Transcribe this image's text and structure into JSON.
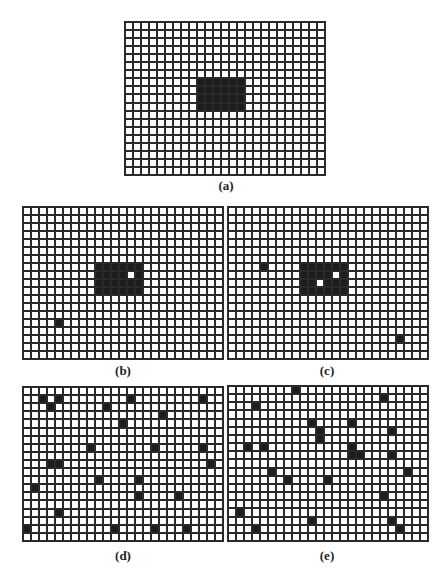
{
  "figure": {
    "grid_cols": 25,
    "grid_rows": 19,
    "colors": {
      "line": "#2a2a2a",
      "dark": "#1c1c1c",
      "light": "#ffffff"
    },
    "panels": [
      {
        "id": "a",
        "label": "(a)",
        "box": {
          "left": 124,
          "top": 21,
          "width": 202,
          "height": 155
        },
        "label_pos": {
          "left": 196,
          "top": 178
        },
        "rects": [
          {
            "col": 9,
            "row": 7,
            "cols": 6,
            "rows": 4
          }
        ],
        "dark_cells": [],
        "light_holes": []
      },
      {
        "id": "b",
        "label": "(b)",
        "box": {
          "left": 22,
          "top": 206,
          "width": 202,
          "height": 154
        },
        "label_pos": {
          "left": 93,
          "top": 363
        },
        "rects": [
          {
            "col": 9,
            "row": 7,
            "cols": 6,
            "rows": 4
          }
        ],
        "dark_cells": [
          [
            4,
            14
          ]
        ],
        "light_holes": [
          [
            13,
            8
          ]
        ]
      },
      {
        "id": "c",
        "label": "(c)",
        "box": {
          "left": 227,
          "top": 206,
          "width": 202,
          "height": 154
        },
        "label_pos": {
          "left": 297,
          "top": 363
        },
        "rects": [
          {
            "col": 9,
            "row": 7,
            "cols": 6,
            "rows": 4
          }
        ],
        "dark_cells": [
          [
            4,
            7
          ],
          [
            21,
            16
          ]
        ],
        "light_holes": [
          [
            13,
            8
          ],
          [
            11,
            9
          ]
        ]
      },
      {
        "id": "d",
        "label": "(d)",
        "box": {
          "left": 22,
          "top": 386,
          "width": 202,
          "height": 156
        },
        "label_pos": {
          "left": 93,
          "top": 548
        },
        "rects": [],
        "dark_cells": [
          [
            2,
            1
          ],
          [
            4,
            1
          ],
          [
            3,
            2
          ],
          [
            13,
            1
          ],
          [
            10,
            2
          ],
          [
            22,
            1
          ],
          [
            17,
            3
          ],
          [
            12,
            4
          ],
          [
            8,
            7
          ],
          [
            16,
            7
          ],
          [
            22,
            7
          ],
          [
            3,
            9
          ],
          [
            4,
            9
          ],
          [
            23,
            9
          ],
          [
            9,
            11
          ],
          [
            14,
            11
          ],
          [
            1,
            12
          ],
          [
            14,
            13
          ],
          [
            19,
            13
          ],
          [
            4,
            15
          ],
          [
            0,
            17
          ],
          [
            11,
            17
          ],
          [
            16,
            17
          ],
          [
            20,
            17
          ]
        ],
        "light_holes": []
      },
      {
        "id": "e",
        "label": "(e)",
        "box": {
          "left": 227,
          "top": 385,
          "width": 202,
          "height": 157
        },
        "label_pos": {
          "left": 297,
          "top": 548
        },
        "rects": [],
        "dark_cells": [
          [
            8,
            0
          ],
          [
            19,
            1
          ],
          [
            3,
            2
          ],
          [
            10,
            4
          ],
          [
            15,
            4
          ],
          [
            11,
            5
          ],
          [
            11,
            6
          ],
          [
            20,
            5
          ],
          [
            2,
            7
          ],
          [
            4,
            7
          ],
          [
            15,
            7
          ],
          [
            15,
            8
          ],
          [
            16,
            8
          ],
          [
            20,
            8
          ],
          [
            22,
            10
          ],
          [
            5,
            10
          ],
          [
            7,
            11
          ],
          [
            12,
            11
          ],
          [
            19,
            13
          ],
          [
            1,
            15
          ],
          [
            10,
            16
          ],
          [
            20,
            16
          ],
          [
            3,
            17
          ],
          [
            21,
            17
          ]
        ],
        "light_holes": []
      }
    ]
  }
}
